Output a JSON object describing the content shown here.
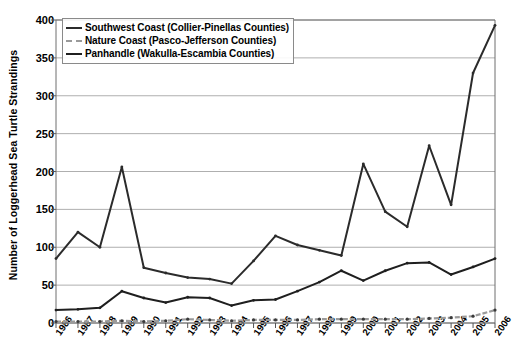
{
  "chart_data": {
    "type": "line",
    "title": "",
    "xlabel": "",
    "ylabel": "Number of Loggerhead Sea Turtle Strandings",
    "ylim": [
      0,
      400
    ],
    "yticks": [
      0,
      50,
      100,
      150,
      200,
      250,
      300,
      350,
      400
    ],
    "grid": true,
    "legend_position": "top-left",
    "categories": [
      "1986",
      "1987",
      "1988",
      "1989",
      "1990",
      "1991",
      "1992",
      "1993",
      "1994",
      "1995",
      "1996",
      "1997",
      "1998",
      "1999",
      "2000",
      "2001",
      "2002",
      "2003",
      "2004",
      "2005",
      "2006"
    ],
    "series": [
      {
        "name": "Southwest Coast (Collier-Pinellas Counties)",
        "color": "#2b2b2b",
        "style": "solid",
        "values": [
          85,
          120,
          100,
          206,
          73,
          66,
          60,
          58,
          52,
          82,
          115,
          103,
          96,
          89,
          210,
          147,
          127,
          234,
          156,
          330,
          393
        ]
      },
      {
        "name": "Nature Coast (Pasco-Jefferson Counties)",
        "color": "#9a9a9a",
        "style": "dashed",
        "values": [
          2,
          2,
          2,
          3,
          2,
          3,
          5,
          4,
          3,
          4,
          4,
          4,
          5,
          5,
          5,
          5,
          5,
          6,
          7,
          9,
          17
        ]
      },
      {
        "name": "Panhandle (Wakulla-Escambia Counties)",
        "color": "#1f1f1f",
        "style": "solid",
        "values": [
          17,
          18,
          20,
          42,
          33,
          27,
          34,
          33,
          23,
          30,
          31,
          42,
          54,
          69,
          56,
          69,
          79,
          80,
          64,
          74,
          85
        ]
      }
    ]
  },
  "legend": {
    "items": [
      {
        "label": "Southwest Coast (Collier-Pinellas Counties)"
      },
      {
        "label": "Nature Coast (Pasco-Jefferson Counties)"
      },
      {
        "label": "Panhandle (Wakulla-Escambia Counties)"
      }
    ]
  }
}
